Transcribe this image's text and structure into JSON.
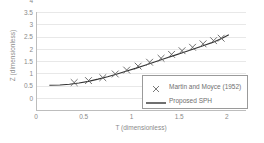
{
  "chart_data": {
    "type": "scatter",
    "title": "",
    "xlabel": "T (dimensionless)",
    "ylabel": "Z (dimensionless)",
    "xlim": [
      0,
      2.2
    ],
    "ylim": [
      0,
      4
    ],
    "xticks": [
      "0",
      "0.5",
      "1",
      "1.5",
      "2"
    ],
    "xtick_values": [
      0,
      0.5,
      1,
      1.5,
      2
    ],
    "yticks": [
      "0",
      "0.5",
      "1",
      "1.5",
      "2",
      "2.5",
      "3",
      "3.5",
      "4"
    ],
    "ytick_values": [
      0,
      0.5,
      1,
      1.5,
      2,
      2.5,
      3,
      3.5,
      4
    ],
    "grid": "horizontal",
    "legend_position": "lower-right",
    "series": [
      {
        "name": "Martin and Moyce (1952)",
        "marker": "x",
        "style": "markers",
        "color": "#606060",
        "x": [
          0.4,
          0.55,
          0.7,
          0.83,
          0.95,
          1.07,
          1.19,
          1.31,
          1.42,
          1.53,
          1.64,
          1.75,
          1.86,
          1.94
        ],
        "y": [
          1.12,
          1.2,
          1.32,
          1.47,
          1.63,
          1.79,
          1.95,
          2.11,
          2.27,
          2.42,
          2.56,
          2.7,
          2.83,
          2.93
        ]
      },
      {
        "name": "Proposed SPH",
        "marker": "none",
        "style": "line",
        "color": "#333333",
        "x": [
          0.14,
          0.25,
          0.35,
          0.45,
          0.55,
          0.65,
          0.75,
          0.85,
          0.95,
          1.05,
          1.15,
          1.25,
          1.35,
          1.45,
          1.55,
          1.65,
          1.75,
          1.85,
          1.95,
          2.02
        ],
        "y": [
          1.01,
          1.02,
          1.05,
          1.1,
          1.17,
          1.26,
          1.36,
          1.47,
          1.59,
          1.71,
          1.84,
          1.97,
          2.1,
          2.23,
          2.36,
          2.49,
          2.62,
          2.76,
          2.93,
          3.07
        ]
      }
    ]
  },
  "legend": {
    "items": [
      {
        "label": "Martin and Moyce (1952)",
        "key": "x-marker-icon"
      },
      {
        "label": "Proposed SPH",
        "key": "line-marker-icon"
      }
    ]
  }
}
